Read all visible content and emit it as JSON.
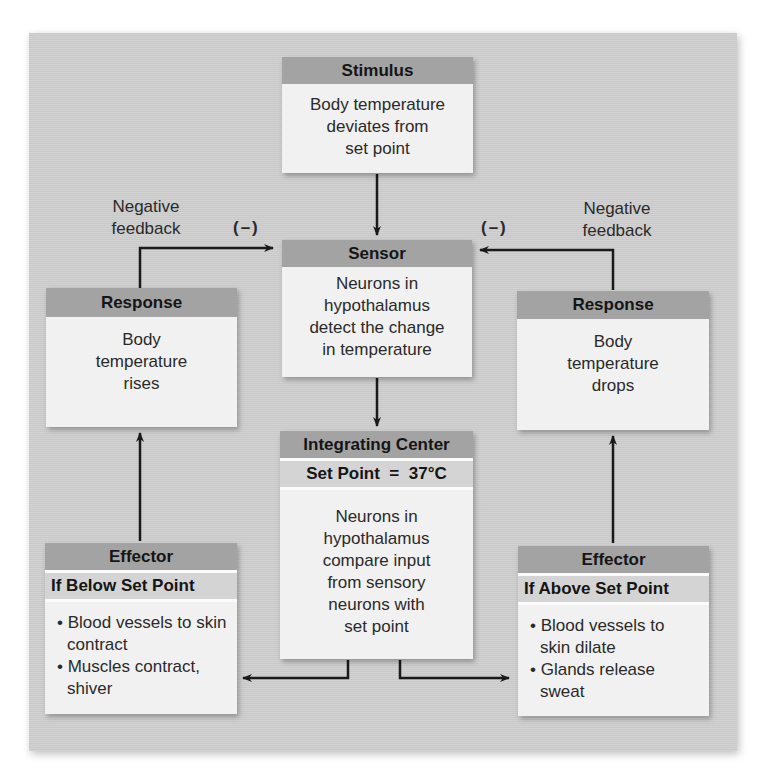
{
  "diagram": {
    "type": "negative-feedback-loop",
    "stimulus": {
      "header": "Stimulus",
      "lines": [
        "Body temperature",
        "deviates from",
        "set point"
      ]
    },
    "sensor": {
      "header": "Sensor",
      "lines": [
        "Neurons in",
        "hypothalamus",
        "detect the change",
        "in temperature"
      ]
    },
    "integrating_center": {
      "header": "Integrating Center",
      "subheader": "Set Point  =  37°C",
      "lines": [
        "Neurons in",
        "hypothalamus",
        "compare input",
        "from sensory",
        "neurons with",
        "set point"
      ]
    },
    "response_left": {
      "header": "Response",
      "lines": [
        "Body",
        "temperature",
        "rises"
      ]
    },
    "response_right": {
      "header": "Response",
      "lines": [
        "Body",
        "temperature",
        "drops"
      ]
    },
    "effector_left": {
      "header": "Effector",
      "subheader": "If Below Set Point",
      "bullets": [
        "• Blood vessels to skin contract",
        "• Muscles contract, shiver"
      ]
    },
    "effector_right": {
      "header": "Effector",
      "subheader": "If Above Set Point",
      "bullets": [
        "• Blood vessels to skin dilate",
        "• Glands release sweat"
      ]
    },
    "feedback_left": {
      "label_lines": [
        "Negative",
        "feedback"
      ],
      "sign": "(–)"
    },
    "feedback_right": {
      "label_lines": [
        "Negative",
        "feedback"
      ],
      "sign": "(–)"
    }
  },
  "colors": {
    "panel": "#cfcfcf",
    "header": "#a3a3a3",
    "subheader": "#d4d4d4",
    "box_body": "#f1f1f1",
    "arrow": "#1a1a1a"
  }
}
